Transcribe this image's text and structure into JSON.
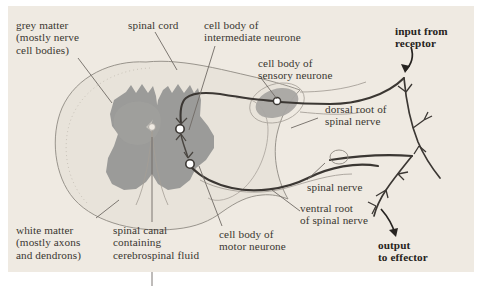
{
  "figure": {
    "kind": "spinal-cord-cross-section-reflex-arc",
    "panel_background": "#efeae2",
    "page_background": "#ffffff",
    "colors": {
      "grey_matter": "#9b9b99",
      "grey_matter_soft": "#a8a7a4",
      "white_matter": "#e6e1d8",
      "outline": "#8e8a82",
      "neurone_dark": "#3b3733",
      "neurone_mid": "#6d6862",
      "leader_line": "#6f6a64",
      "text": "#3a3631",
      "text_bold": "#262320",
      "synapse_fill": "#ffffff"
    },
    "labels": {
      "grey_matter": "grey matter\n(mostly nerve\ncell bodies)",
      "spinal_cord": "spinal cord",
      "intermediate_neurone": "cell body of\nintermediate neurone",
      "sensory_neurone": "cell body of\nsensory neurone",
      "dorsal_root": "dorsal root of\nspinal nerve",
      "input_from_receptor": "input from\nreceptor",
      "spinal_nerve": "spinal nerve",
      "ventral_root": "ventral root\nof spinal nerve",
      "output_to_effector": "output\nto effector",
      "motor_neurone": "cell body of\nmotor neurone",
      "spinal_canal": "spinal canal\ncontaining\ncerebrospinal fluid",
      "white_matter": "white matter\n(mostly axons\nand dendrons)"
    },
    "label_lines": [
      {
        "name": "grey-matter",
        "x1": 78,
        "y1": 58,
        "x2": 112,
        "y2": 103
      },
      {
        "name": "spinal-cord",
        "x1": 155,
        "y1": 32,
        "x2": 177,
        "y2": 70
      },
      {
        "name": "intermediate-neurone",
        "x1": 215,
        "y1": 45,
        "x2": 189,
        "y2": 130
      },
      {
        "name": "sensory-neurone",
        "x1": 260,
        "y1": 78,
        "x2": 277,
        "y2": 100
      },
      {
        "name": "dorsal-root",
        "x1": 318,
        "y1": 118,
        "x2": 291,
        "y2": 128
      },
      {
        "name": "spinal-nerve",
        "x1": 306,
        "y1": 180,
        "x2": 325,
        "y2": 163
      },
      {
        "name": "ventral-root",
        "x1": 300,
        "y1": 212,
        "x2": 273,
        "y2": 190
      },
      {
        "name": "motor-neurone",
        "x1": 222,
        "y1": 226,
        "x2": 199,
        "y2": 164
      },
      {
        "name": "spinal-canal",
        "x1": 152,
        "y1": 222,
        "x2": 152,
        "y2": 136
      },
      {
        "name": "white-matter",
        "x1": 96,
        "y1": 218,
        "x2": 118,
        "y2": 201
      }
    ],
    "synapses": [
      {
        "name": "synapse-sensory-to-intermediate",
        "cx": 180,
        "cy": 129,
        "r": 4.2
      },
      {
        "name": "synapse-intermediate-to-motor",
        "cx": 190,
        "cy": 164,
        "r": 4.2
      },
      {
        "name": "cell-body-sensory-neurone",
        "cx": 277,
        "cy": 101,
        "r": 3.6
      }
    ],
    "arrows": {
      "input": {
        "name": "input-arrow",
        "from": [
          412,
          46
        ],
        "to": [
          403,
          72
        ]
      },
      "output": {
        "name": "output-arrow",
        "from": [
          380,
          208
        ],
        "to": [
          395,
          236
        ]
      }
    }
  }
}
